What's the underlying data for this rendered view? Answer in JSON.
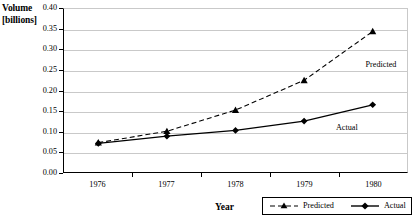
{
  "chart_data": {
    "type": "line",
    "title": "",
    "xlabel": "Year",
    "ylabel": "Volume [billions]",
    "ylabel_line1": "Volume",
    "ylabel_line2": "[billions]",
    "categories": [
      "1976",
      "1977",
      "1978",
      "1979",
      "1980"
    ],
    "x": [
      1976,
      1977,
      1978,
      1979,
      1980
    ],
    "xlim": [
      1975.6,
      1980.4
    ],
    "ylim": [
      0.0,
      0.4
    ],
    "ytick_step": 0.05,
    "ytick_labels": [
      "0.00",
      "0.05",
      "0.10",
      "0.15",
      "0.20",
      "0.25",
      "0.30",
      "0.35",
      "0.40"
    ],
    "ytick_values": [
      0.0,
      0.05,
      0.1,
      0.15,
      0.2,
      0.25,
      0.3,
      0.35,
      0.4
    ],
    "grid": "horizontal",
    "legend_position": "bottom",
    "series": [
      {
        "name": "Predicted",
        "values": [
          0.072,
          0.1,
          0.152,
          0.225,
          0.345
        ],
        "line_style": "dashed",
        "marker": "triangle",
        "color": "#000000"
      },
      {
        "name": "Actual",
        "values": [
          0.07,
          0.088,
          0.102,
          0.125,
          0.165
        ],
        "line_style": "solid",
        "marker": "diamond",
        "color": "#000000"
      }
    ],
    "annotations": [
      {
        "text": "Predicted",
        "x": 1980.0,
        "y": 0.262
      },
      {
        "text": "Actual",
        "x": 1979.6,
        "y": 0.108
      }
    ]
  },
  "legend": {
    "items": [
      {
        "label": "Predicted",
        "style": "dashed-triangle"
      },
      {
        "label": "Actual",
        "style": "solid-diamond"
      }
    ]
  }
}
